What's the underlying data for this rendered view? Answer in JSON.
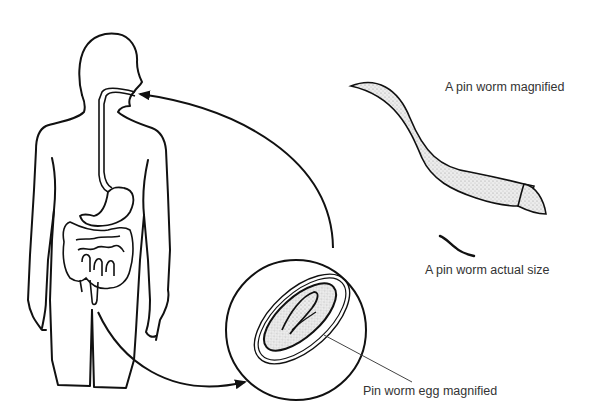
{
  "diagram": {
    "labels": {
      "worm_magnified": "A pin worm magnified",
      "worm_actual_size": "A pin worm actual size",
      "egg_magnified": "Pin worm egg magnified"
    },
    "nodes": [
      {
        "id": "human-body",
        "description": "Human body outline with digestive tract"
      },
      {
        "id": "egg-magnified",
        "description": "Magnified pin worm egg in circle"
      },
      {
        "id": "worm-magnified",
        "description": "Magnified pin worm"
      },
      {
        "id": "worm-actual",
        "description": "Pin worm actual size"
      }
    ],
    "edges": [
      {
        "from": "human-body",
        "to": "egg-magnified",
        "description": "Arrow from anus to egg circle"
      },
      {
        "from": "egg-magnified",
        "to": "human-body",
        "description": "Arrow from egg circle to mouth"
      }
    ],
    "colors": {
      "line": "#111111",
      "text": "#333333",
      "stipple": "#cfcfcf"
    }
  }
}
